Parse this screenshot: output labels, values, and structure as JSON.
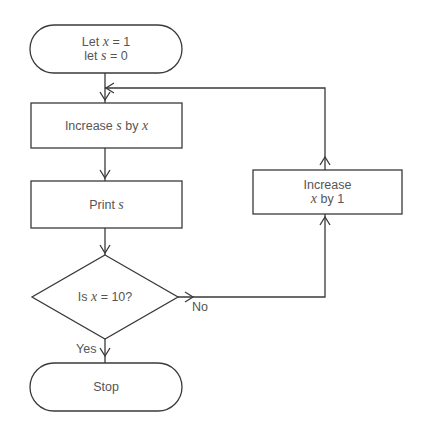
{
  "diagram": {
    "type": "flowchart",
    "nodes": {
      "start": {
        "kind": "terminator",
        "line1_prefix": "Let ",
        "line1_var": "x",
        "line1_suffix": " = 1",
        "line2_prefix": "let ",
        "line2_var": "s",
        "line2_suffix": " = 0"
      },
      "increase_s": {
        "kind": "process",
        "prefix": "Increase ",
        "var1": "s",
        "middle": " by ",
        "var2": "x"
      },
      "print": {
        "kind": "process",
        "prefix": "Print ",
        "var": "s"
      },
      "decision": {
        "kind": "decision",
        "prefix": "Is ",
        "var": "x",
        "suffix": " = 10?"
      },
      "increase_x": {
        "kind": "process",
        "line1": "Increase",
        "line2_var": "x",
        "line2_suffix": " by 1"
      },
      "stop": {
        "kind": "terminator",
        "label": "Stop"
      }
    },
    "edge_labels": {
      "yes": "Yes",
      "no": "No"
    },
    "edges": [
      {
        "from": "start",
        "to": "increase_s"
      },
      {
        "from": "increase_s",
        "to": "print"
      },
      {
        "from": "print",
        "to": "decision"
      },
      {
        "from": "decision",
        "to": "stop",
        "label": "Yes"
      },
      {
        "from": "decision",
        "to": "increase_x",
        "label": "No"
      },
      {
        "from": "increase_x",
        "to": "increase_s"
      }
    ]
  }
}
